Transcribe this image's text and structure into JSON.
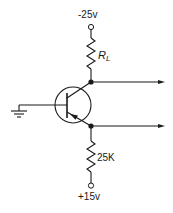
{
  "diagram": {
    "type": "transistor-circuit",
    "supply_top": {
      "label": "-25v"
    },
    "supply_bottom": {
      "label": "+15v"
    },
    "collector_resistor": {
      "label": "R",
      "subscript": "L"
    },
    "emitter_resistor": {
      "label": "25K"
    },
    "transistor": {
      "type": "PNP"
    },
    "ground": {
      "name": "ground"
    },
    "outputs": [
      "collector-output",
      "emitter-output"
    ],
    "stroke_color": "#1a1a1a"
  }
}
